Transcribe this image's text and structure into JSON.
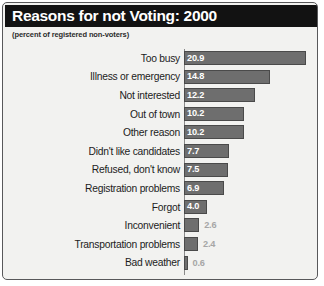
{
  "card": {
    "title": "Reasons for not Voting: 2000",
    "subtitle": "(percent of registered non-voters)"
  },
  "colors": {
    "title_bar_bg": "#121212",
    "title_text": "#ffffff",
    "card_bg": "#f2f2f0",
    "card_border": "#58585a",
    "bar_fill": "#6e6e6e",
    "bar_stroke": "#4a4a4a",
    "value_inside_text": "#ffffff",
    "value_outside_text": "#a6a6a6",
    "label_text": "#1c1c1c"
  },
  "chart_data": {
    "type": "bar",
    "orientation": "horizontal",
    "title": "Reasons for not Voting: 2000",
    "subtitle": "(percent of registered non-voters)",
    "xlabel": "",
    "ylabel": "",
    "xlim": [
      0,
      22
    ],
    "grid": false,
    "legend": null,
    "units": "percent",
    "categories": [
      "Too busy",
      "Illness or emergency",
      "Not interested",
      "Out of town",
      "Other reason",
      "Didn't like candidates",
      "Refused, don't know",
      "Registration problems",
      "Forgot",
      "Inconvenient",
      "Transportation problems",
      "Bad weather"
    ],
    "values": [
      20.9,
      14.8,
      12.2,
      10.2,
      10.2,
      7.7,
      7.5,
      6.9,
      4.0,
      2.6,
      2.4,
      0.6
    ],
    "value_labels": [
      "20.9",
      "14.8",
      "12.2",
      "10.2",
      "10.2",
      "7.7",
      "7.5",
      "6.9",
      "4.0",
      "2.6",
      "2.4",
      "0.6"
    ],
    "label_placement": [
      "inside",
      "inside",
      "inside",
      "inside",
      "inside",
      "inside",
      "inside",
      "inside",
      "inside",
      "outside",
      "outside",
      "outside"
    ]
  }
}
